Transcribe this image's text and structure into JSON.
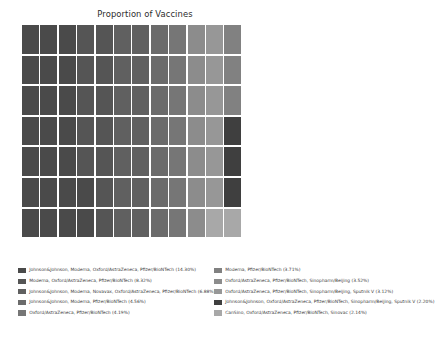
{
  "chart_data": {
    "type": "waffle",
    "title": "Proportion of Vaccines",
    "xlabel": "",
    "ylabel": "",
    "grid": {
      "columns": 12,
      "rows": 7,
      "total_cells": 84
    },
    "legend_position": "bottom",
    "categories": [
      "Johnson&Johnson, Moderna, Oxford/AstraZeneca, Pfizer/BioNTech",
      "Moderna, Oxford/AstraZeneca, Pfizer/BioNTech",
      "Johnson&Johnson, Moderna, Novavax, Oxford/AstraZeneca, Pfizer/BioNTech",
      "Johnson&Johnson, Moderna, Pfizer/BioNTech",
      "Oxford/AstraZeneca, Pfizer/BioNTech",
      "Moderna, Pfizer/BioNTech",
      "Oxford/AstraZeneca, Pfizer/BioNTech, Sinopharm/Beijing",
      "Oxford/AstraZeneca, Pfizer/BioNTech, Sinopharm/Beijing, Sputnik V",
      "Johnson&Johnson, Oxford/AstraZeneca, Pfizer/BioNTech, Sinopharm/Beijing, Sputnik V",
      "CanSino, Oxford/AstraZeneca, Pfizer/BioNTech, Sinovac"
    ],
    "values": [
      14.3,
      8.32,
      6.88,
      4.56,
      4.19,
      3.71,
      3.52,
      3.12,
      2.2,
      2.14
    ],
    "value_unit": "%",
    "colors": [
      "#4a4a4a",
      "#555555",
      "#606060",
      "#6b6b6b",
      "#767676",
      "#818181",
      "#8c8c8c",
      "#979797",
      "#3f3f3f",
      "#a8a8a8"
    ],
    "cell_sequence": [
      0,
      0,
      0,
      1,
      1,
      2,
      2,
      3,
      4,
      6,
      7,
      5,
      0,
      0,
      0,
      1,
      1,
      2,
      2,
      3,
      4,
      6,
      7,
      5,
      0,
      0,
      0,
      1,
      1,
      2,
      2,
      3,
      4,
      6,
      7,
      5,
      0,
      0,
      0,
      1,
      1,
      2,
      2,
      3,
      4,
      6,
      7,
      8,
      0,
      0,
      0,
      1,
      1,
      2,
      2,
      3,
      4,
      6,
      7,
      8,
      0,
      0,
      0,
      0,
      1,
      2,
      2,
      3,
      4,
      6,
      7,
      8,
      0,
      0,
      0,
      0,
      1,
      2,
      2,
      3,
      4,
      6,
      9,
      9
    ]
  },
  "legend": {
    "columns": [
      {
        "items": [
          {
            "label": "Johnson&Johnson, Moderna, Oxford/AstraZeneca, Pfizer/BioNTech (14.30%)",
            "color": "#4a4a4a"
          },
          {
            "label": "Moderna, Oxford/AstraZeneca, Pfizer/BioNTech (8.32%)",
            "color": "#555555"
          },
          {
            "label": "Johnson&Johnson, Moderna, Novavax, Oxford/AstraZeneca, Pfizer/BioNTech (6.88%)",
            "color": "#606060"
          },
          {
            "label": "Johnson&Johnson, Moderna, Pfizer/BioNTech (4.56%)",
            "color": "#6b6b6b"
          },
          {
            "label": "Oxford/AstraZeneca, Pfizer/BioNTech (4.19%)",
            "color": "#767676"
          }
        ]
      },
      {
        "items": [
          {
            "label": "Moderna, Pfizer/BioNTech (3.71%)",
            "color": "#818181"
          },
          {
            "label": "Oxford/AstraZeneca, Pfizer/BioNTech, Sinopharm/Beijing (3.52%)",
            "color": "#8c8c8c"
          },
          {
            "label": "Oxford/AstraZeneca, Pfizer/BioNTech, Sinopharm/Beijing, Sputnik V (3.12%)",
            "color": "#979797"
          },
          {
            "label": "Johnson&Johnson, Oxford/AstraZeneca, Pfizer/BioNTech, Sinopharm/Beijing, Sputnik V (2.20%)",
            "color": "#3f3f3f"
          },
          {
            "label": "CanSino, Oxford/AstraZeneca, Pfizer/BioNTech, Sinovac (2.14%)",
            "color": "#a8a8a8"
          }
        ]
      }
    ]
  }
}
